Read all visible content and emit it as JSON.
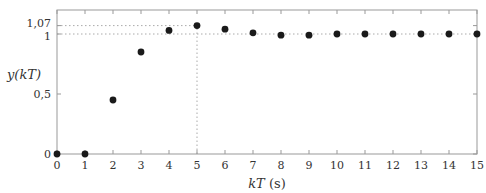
{
  "chart_data": {
    "type": "scatter",
    "title": "",
    "xlabel_parts": [
      "kT",
      " (s)"
    ],
    "ylabel_parts": [
      "y(kT)"
    ],
    "xlim": [
      0,
      15
    ],
    "ylim": [
      0,
      1.12
    ],
    "x_ticks": [
      0,
      1,
      2,
      3,
      4,
      5,
      6,
      7,
      8,
      9,
      10,
      11,
      12,
      13,
      14,
      15
    ],
    "x_tick_labels": [
      "0",
      "1",
      "2",
      "3",
      "4",
      "5",
      "6",
      "7",
      "8",
      "9",
      "10",
      "11",
      "12",
      "13",
      "14",
      "15"
    ],
    "y_ticks": [
      0,
      0.5,
      1,
      1.07
    ],
    "y_tick_labels": [
      "0",
      "0,5",
      "1",
      "1,07"
    ],
    "grid": false,
    "x": [
      0,
      1,
      2,
      3,
      4,
      5,
      6,
      7,
      8,
      9,
      10,
      11,
      12,
      13,
      14,
      15
    ],
    "y": [
      0,
      0,
      0.45,
      0.85,
      1.03,
      1.07,
      1.04,
      1.01,
      0.99,
      0.99,
      1.0,
      1.0,
      1.0,
      1.0,
      1.0,
      1.0
    ],
    "reference_lines": [
      {
        "type": "horizontal",
        "y": 1.07,
        "style": "dotted",
        "from_x": 0,
        "to_x": 5
      },
      {
        "type": "horizontal",
        "y": 1.0,
        "style": "dotted",
        "from_x": 0,
        "to_x": 15
      },
      {
        "type": "vertical",
        "x": 5,
        "style": "dotted",
        "from_y": 0,
        "to_y": 1.07
      }
    ],
    "marker_color": "#1a1a1a",
    "axis_color": "#999999",
    "ref_line_color": "#aaaaaa"
  }
}
